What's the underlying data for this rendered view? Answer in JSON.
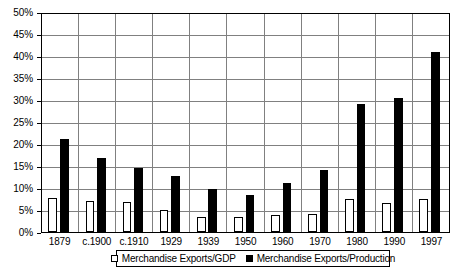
{
  "chart_data": {
    "type": "bar",
    "title": "",
    "subtitle": "",
    "xlabel": "",
    "ylabel": "",
    "categories": [
      "1879",
      "c.1900",
      "c.1910",
      "1929",
      "1939",
      "1950",
      "1960",
      "1970",
      "1980",
      "1990",
      "1997"
    ],
    "series": [
      {
        "name": "Merchandise Exports/GDP",
        "marker": "open-square",
        "color": "#ffffff",
        "border_color": "#000000",
        "values": [
          7.8,
          7.0,
          6.8,
          4.9,
          3.3,
          3.3,
          3.8,
          4.1,
          7.5,
          6.6,
          7.4
        ]
      },
      {
        "name": "Merchandise Exports/Production",
        "marker": "solid-square",
        "color": "#000000",
        "border_color": "#000000",
        "values": [
          21.1,
          16.9,
          14.5,
          12.8,
          9.8,
          8.3,
          11.2,
          14.1,
          29.1,
          30.5,
          40.9
        ]
      }
    ],
    "ylim": [
      0,
      50
    ],
    "ytick_step": 5,
    "ytick_labels": [
      "50%",
      "45%",
      "40%",
      "35%",
      "30%",
      "25%",
      "20%",
      "15%",
      "10%",
      "5%",
      "0%"
    ],
    "ytick_values": [
      50,
      45,
      40,
      35,
      30,
      25,
      20,
      15,
      10,
      5,
      0
    ],
    "unit": "%",
    "grid": true,
    "grid_axis": "both",
    "grid_color": "#808080",
    "legend_position": "bottom-center",
    "frame": true,
    "frame_color": "#000000",
    "background": "#ffffff"
  },
  "legend": {
    "entries": [
      {
        "label": "Merchandise Exports/GDP"
      },
      {
        "label": "Merchandise Exports/Production"
      }
    ]
  }
}
